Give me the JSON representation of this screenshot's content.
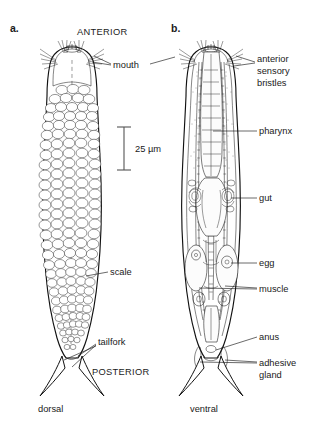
{
  "figure": {
    "background": "#ffffff",
    "ink_color": "#1a1a1a"
  },
  "panels": [
    {
      "id": "a",
      "label": "a.",
      "view_label": "dorsal",
      "description": "dorsal view showing body scales"
    },
    {
      "id": "b",
      "label": "b.",
      "view_label": "ventral",
      "description": "ventral view showing internal anatomy"
    }
  ],
  "orientation_labels": {
    "anterior": "ANTERIOR",
    "posterior": "POSTERIOR"
  },
  "scale_bar": {
    "text": "25 µm",
    "value": 25,
    "unit": "µm"
  },
  "annotations": {
    "mouth": "mouth",
    "scale": "scale",
    "tailfork": "tailfork",
    "anterior_sensory_bristles_line1": "anterior",
    "anterior_sensory_bristles_line2": "sensory",
    "anterior_sensory_bristles_line3": "bristles",
    "pharynx": "pharynx",
    "gut": "gut",
    "egg": "egg",
    "muscle": "muscle",
    "anus": "anus",
    "adhesive_gland_line1": "adhesive",
    "adhesive_gland_line2": "gland"
  }
}
